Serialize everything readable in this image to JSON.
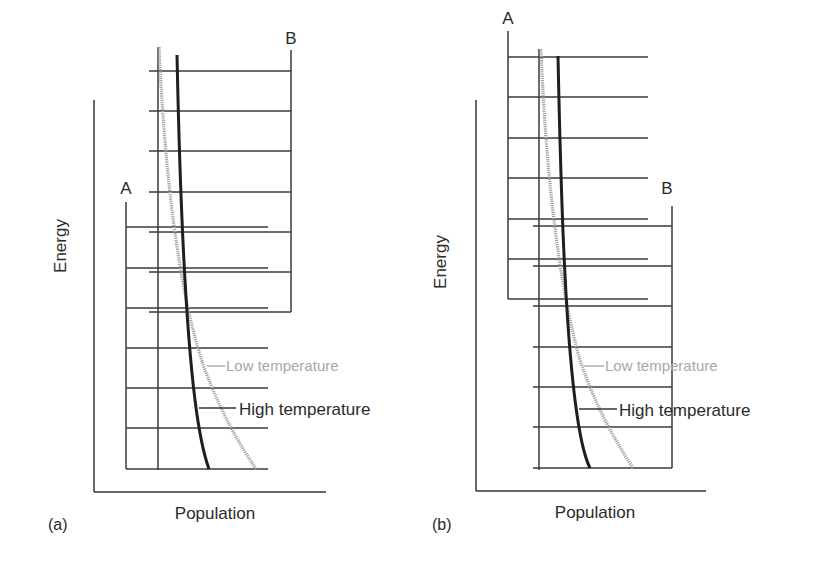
{
  "figure": {
    "panels": [
      {
        "id": "a",
        "caption": "(a)",
        "x_axis_label": "Population",
        "y_axis_label": "Energy",
        "ladder_a_label": "A",
        "ladder_b_label": "B",
        "legend": {
          "low": "Low temperature",
          "high": "High temperature"
        },
        "description": "Ladder A (lower energy levels) and ladder B (higher energy levels) overlap; population curves decrease with energy"
      },
      {
        "id": "b",
        "caption": "(b)",
        "x_axis_label": "Population",
        "y_axis_label": "Energy",
        "ladder_a_label": "A",
        "ladder_b_label": "B",
        "legend": {
          "low": "Low temperature",
          "high": "High temperature"
        },
        "description": "Ladder A now lies higher in energy than ladder B"
      }
    ],
    "colors": {
      "line": "#3a3a3a",
      "high_curve": "#1e1e1e",
      "low_curve": "#a0a0a0",
      "low_text": "#a8a8a8"
    }
  }
}
